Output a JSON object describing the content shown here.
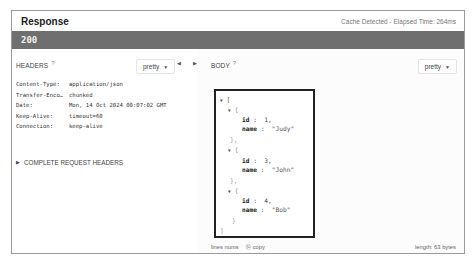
{
  "window": {
    "title": "Response",
    "meta": "Cache Detected - Elapsed Time: 264ms",
    "status_code": "200"
  },
  "headers_pane": {
    "label": "HEADERS",
    "help_icon": "?",
    "format_select": "pretty",
    "rows": [
      {
        "key": "Content-Type:",
        "value": "application/json"
      },
      {
        "key": "Transfer-Enco…",
        "value": "chunked"
      },
      {
        "key": "Date:",
        "value": "Mon, 14 Oct 2024 00:07:02 GMT"
      },
      {
        "key": "Keep-Alive:",
        "value": "timeout=60"
      },
      {
        "key": "Connection:",
        "value": "keep-alive"
      }
    ],
    "complete_request_headers": "COMPLETE REQUEST HEADERS"
  },
  "divider": {
    "left_arrow": "◀",
    "right_arrow": "▶"
  },
  "body_pane": {
    "label": "BODY",
    "help_icon": "?",
    "format_select": "pretty",
    "json_lines": [
      {
        "indent": 0,
        "toggle": "▼",
        "text": "["
      },
      {
        "indent": 1,
        "toggle": "▼",
        "text": "{"
      },
      {
        "indent": 2,
        "key": "id",
        "sep": " :  ",
        "val": "1,"
      },
      {
        "indent": 2,
        "key": "name",
        "sep": " :  ",
        "val": "\"Judy\""
      },
      {
        "indent": 1,
        "text": "},"
      },
      {
        "indent": 1,
        "toggle": "▼",
        "text": "{"
      },
      {
        "indent": 2,
        "key": "id",
        "sep": " :  ",
        "val": "3,"
      },
      {
        "indent": 2,
        "key": "name",
        "sep": " :  ",
        "val": "\"John\""
      },
      {
        "indent": 1,
        "text": "},"
      },
      {
        "indent": 1,
        "toggle": "▼",
        "text": "{"
      },
      {
        "indent": 2,
        "key": "id",
        "sep": " :  ",
        "val": "4,"
      },
      {
        "indent": 2,
        "key": "name",
        "sep": " :  ",
        "val": "\"Bob\""
      },
      {
        "indent": 1,
        "text": "}"
      },
      {
        "indent": 0,
        "text": "]"
      }
    ],
    "footer": {
      "line_nums": "lines nums",
      "copy": "copy",
      "length": "length: 63 bytes"
    }
  },
  "colors": {
    "status_bar": "#6f6f6f",
    "panel_border": "#9a9a9a",
    "highlight_border": "#222222"
  }
}
